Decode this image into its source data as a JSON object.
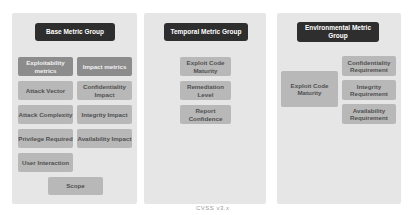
{
  "colors": {
    "panel_bg": "#e6e6e6",
    "title_bg": "#2e2e2e",
    "header_box_bg": "#8c8c8c",
    "metric_box_bg": "#b8b8b8"
  },
  "base": {
    "title": "Base Metric Group",
    "exploitability_header": "Exploitability metrics",
    "impact_header": "Impact metrics",
    "exploitability": [
      "Attack Vector",
      "Attack Complexity",
      "Privilege Required",
      "User Interaction"
    ],
    "impact": [
      "Confidentiality Impact",
      "Integrity Impact",
      "Availability Impact"
    ],
    "scope": "Scope"
  },
  "temporal": {
    "title": "Temporal Metric Group",
    "metrics": [
      "Exploit Code Maturity",
      "Remediation Level",
      "Report Confidence"
    ]
  },
  "environmental": {
    "title": "Environmental Metric Group",
    "left_metric": "Exploit Code Maturity",
    "requirements": [
      "Confidentiality Requirement",
      "Integrity Requirement",
      "Availability Requirement"
    ]
  },
  "caption": "CVSS v3.x"
}
